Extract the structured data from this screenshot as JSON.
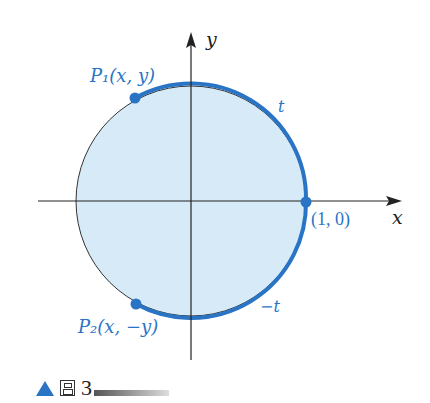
{
  "figure": {
    "axes": {
      "x_label": "x",
      "y_label": "y"
    },
    "points": {
      "p1": {
        "label": "P₁(x, y)"
      },
      "p2": {
        "label": "P₂(x, −y)"
      },
      "origin_point": {
        "label": "(1, 0)"
      }
    },
    "arcs": {
      "upper": "t",
      "lower": "−t"
    },
    "colors": {
      "fill": "#d6ebf7",
      "accent": "#2a74c6",
      "axis": "#222222",
      "text_blue": "#2a74c6"
    }
  },
  "caption": {
    "prefix_glyph": "图",
    "number": "3"
  }
}
